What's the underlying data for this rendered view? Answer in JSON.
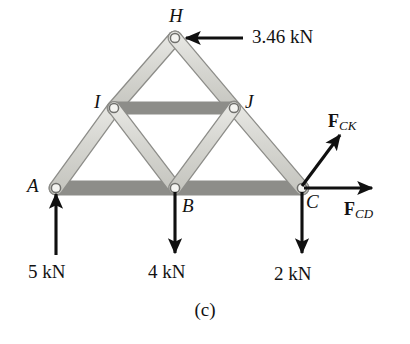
{
  "figure": {
    "caption": "(c)",
    "type": "free-body-diagram-truss",
    "colors": {
      "member_fill": "#d8d8d4",
      "member_stroke": "#8a8a86",
      "joint_fill": "#f2f2ef",
      "joint_stroke": "#6f6f6c",
      "arrow": "#101010",
      "text": "#121212",
      "background": "#ffffff"
    }
  },
  "nodes": [
    {
      "id": "H",
      "label": "H",
      "x": 175,
      "y": 38
    },
    {
      "id": "I",
      "label": "I",
      "x": 114,
      "y": 108
    },
    {
      "id": "J",
      "label": "J",
      "x": 234,
      "y": 108
    },
    {
      "id": "A",
      "label": "A",
      "x": 56,
      "y": 188
    },
    {
      "id": "B",
      "label": "B",
      "x": 175,
      "y": 188
    },
    {
      "id": "C",
      "label": "C",
      "x": 302,
      "y": 188
    }
  ],
  "members": [
    {
      "id": "AI",
      "from": "A",
      "to": "I"
    },
    {
      "id": "IH",
      "from": "I",
      "to": "H"
    },
    {
      "id": "HJ",
      "from": "H",
      "to": "J"
    },
    {
      "id": "JC",
      "from": "J",
      "to": "C"
    },
    {
      "id": "AB",
      "from": "A",
      "to": "B"
    },
    {
      "id": "BC",
      "from": "B",
      "to": "C"
    },
    {
      "id": "IJ",
      "from": "I",
      "to": "J"
    },
    {
      "id": "IB",
      "from": "I",
      "to": "B"
    },
    {
      "id": "JB",
      "from": "J",
      "to": "B"
    }
  ],
  "loads": [
    {
      "id": "load-H",
      "label": "3.46 kN",
      "value": 3.46,
      "unit": "kN",
      "at_node": "H",
      "direction": "left"
    },
    {
      "id": "reaction-A",
      "label": "5 kN",
      "value": 5,
      "unit": "kN",
      "at_node": "A",
      "direction": "up"
    },
    {
      "id": "load-B",
      "label": "4 kN",
      "value": 4,
      "unit": "kN",
      "at_node": "B",
      "direction": "down"
    },
    {
      "id": "load-C",
      "label": "2 kN",
      "value": 2,
      "unit": "kN",
      "at_node": "C",
      "direction": "down"
    }
  ],
  "member_forces": [
    {
      "id": "F_CK",
      "symbol": "F",
      "subscript": "CK",
      "at_node": "C",
      "direction": "up-right"
    },
    {
      "id": "F_CD",
      "symbol": "F",
      "subscript": "CD",
      "at_node": "C",
      "direction": "right"
    }
  ]
}
